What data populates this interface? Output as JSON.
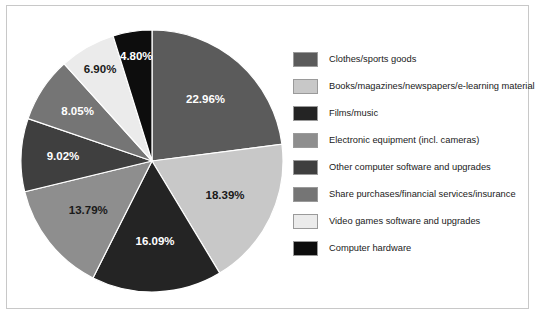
{
  "chart_data": {
    "type": "pie",
    "title": "",
    "subtitle": "",
    "xlabel": "",
    "ylabel": "",
    "grid": false,
    "legend_position": "right",
    "start_angle_deg": 0,
    "direction": "clockwise",
    "value_unit": "%",
    "total": 100.0,
    "categories": [
      "Clothes/sports goods",
      "Books/magazines/newspapers/e-learning material",
      "Films/music",
      "Electronic equipment (incl. cameras)",
      "Other computer software and upgrades",
      "Share purchases/financial services/insurance",
      "Video games software and upgrades",
      "Computer hardware"
    ],
    "values": [
      22.96,
      18.39,
      16.09,
      13.79,
      9.02,
      8.05,
      6.9,
      4.8
    ],
    "data_labels": [
      "22.96%",
      "18.39%",
      "16.09%",
      "13.79%",
      "9.02%",
      "8.05%",
      "6.90%",
      "4.80%"
    ],
    "colors": [
      "#5b5b5b",
      "#c8c8c8",
      "#242424",
      "#8e8e8e",
      "#3f3f3f",
      "#757575",
      "#ebebeb",
      "#0d0d0d"
    ],
    "label_text_colors": [
      "#ffffff",
      "#1a1a1a",
      "#ffffff",
      "#1a1a1a",
      "#ffffff",
      "#ffffff",
      "#1a1a1a",
      "#ffffff"
    ],
    "slice_border_color": "#ffffff"
  },
  "legend": {
    "items": [
      {
        "label": "Clothes/sports goods",
        "color": "#5b5b5b"
      },
      {
        "label": "Books/magazines/newspapers/e-learning material",
        "color": "#c8c8c8"
      },
      {
        "label": "Films/music",
        "color": "#242424"
      },
      {
        "label": "Electronic equipment (incl. cameras)",
        "color": "#8e8e8e"
      },
      {
        "label": "Other computer software and upgrades",
        "color": "#3f3f3f"
      },
      {
        "label": "Share purchases/financial services/insurance",
        "color": "#757575"
      },
      {
        "label": "Video games software and upgrades",
        "color": "#ebebeb"
      },
      {
        "label": "Computer hardware",
        "color": "#0d0d0d"
      }
    ]
  },
  "frame": {
    "border_color": "#c8c8c8",
    "background": "#ffffff"
  }
}
